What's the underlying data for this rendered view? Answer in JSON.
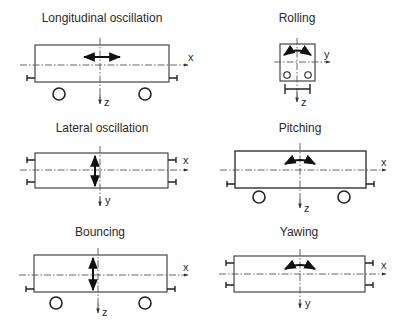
{
  "panels": [
    {
      "id": "longitudinal",
      "title": "Longitudinal oscillation",
      "axis_h": "x",
      "axis_v": "z",
      "motion": "horizontal-double-arrow"
    },
    {
      "id": "rolling",
      "title": "Rolling",
      "axis_h": "y",
      "axis_v": "z",
      "motion": "curved-double-arrow"
    },
    {
      "id": "lateral",
      "title": "Lateral oscillation",
      "axis_h": "x",
      "axis_v": "y",
      "motion": "vertical-double-arrow"
    },
    {
      "id": "pitching",
      "title": "Pitching",
      "axis_h": "x",
      "axis_v": "z",
      "motion": "curved-double-arrow"
    },
    {
      "id": "bouncing",
      "title": "Bouncing",
      "axis_h": "x",
      "axis_v": "z",
      "motion": "vertical-double-arrow"
    },
    {
      "id": "yawing",
      "title": "Yawing",
      "axis_h": "x",
      "axis_v": "y",
      "motion": "curved-double-arrow"
    }
  ],
  "colors": {
    "line": "#333333",
    "text": "#2a2a2a",
    "background": "#ffffff"
  }
}
